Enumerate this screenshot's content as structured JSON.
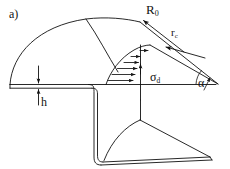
{
  "figure": {
    "panel_label": "a)",
    "background_color": "#ffffff",
    "line_color": "#111111"
  },
  "labels": {
    "roller_radius": {
      "text": "R",
      "subscript": "0",
      "name": "roller-radius"
    },
    "contact_radius": {
      "text": "r",
      "subscript": "c",
      "name": "contact-radius"
    },
    "deformation_stress": {
      "text": "σ",
      "subscript": "d",
      "name": "deformation-stress"
    },
    "contact_angle": {
      "text": "α",
      "subscript": "",
      "name": "contact-angle"
    },
    "sheet_thickness": {
      "text": "h",
      "subscript": "",
      "name": "sheet-thickness"
    }
  },
  "geometry": {
    "baseline_y": 85,
    "apex": {
      "x": 140,
      "y": 22
    },
    "convergence_point": {
      "x": 218,
      "y": 84
    },
    "stress_arrow_count": 6
  }
}
